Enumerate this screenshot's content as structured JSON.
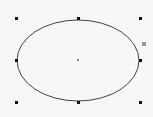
{
  "canvas": {
    "background": "#f7f7f7"
  },
  "shape": {
    "type": "ellipse",
    "selected": true,
    "cx": 78,
    "cy": 60.5,
    "rx": 61,
    "ry": 40.5,
    "stroke": "#444444",
    "fill": "none"
  },
  "handles": [
    {
      "name": "handle-top-left",
      "x": 16,
      "y": 18
    },
    {
      "name": "handle-top-center",
      "x": 78,
      "y": 18
    },
    {
      "name": "handle-top-right",
      "x": 140,
      "y": 18
    },
    {
      "name": "handle-middle-left",
      "x": 16,
      "y": 60
    },
    {
      "name": "handle-middle-right",
      "x": 140,
      "y": 60
    },
    {
      "name": "handle-bottom-left",
      "x": 16,
      "y": 102
    },
    {
      "name": "handle-bottom-center",
      "x": 78,
      "y": 102
    },
    {
      "name": "handle-bottom-right",
      "x": 140,
      "y": 102
    }
  ],
  "aux_handle": {
    "x": 143,
    "y": 43,
    "color": "#9a9a9a"
  },
  "center_point": {
    "x": 78,
    "y": 60
  }
}
